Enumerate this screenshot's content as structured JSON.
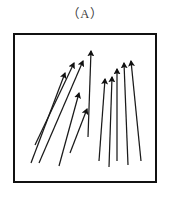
{
  "figure": {
    "caption": "（A）",
    "panel_label": "A",
    "background_color": "#ffffff",
    "frame": {
      "border_color": "#111111",
      "border_width_px": 2,
      "x": 13,
      "y": 33,
      "width": 144,
      "height": 150
    },
    "stroke_color": "#1a1a1a",
    "arrow_count": 11
  },
  "chart_data": {
    "type": "scatter",
    "title": "（A）",
    "xlabel": "",
    "ylabel": "",
    "grid": false,
    "legend": null,
    "xlim": [
      0,
      144
    ],
    "ylim": [
      0,
      150
    ],
    "arrows": [
      {
        "id": 1,
        "x1": 18,
        "y1": 130,
        "x2": 52,
        "y2": 40,
        "angle_deg": 69
      },
      {
        "id": 2,
        "x1": 22,
        "y1": 112,
        "x2": 61,
        "y2": 30,
        "angle_deg": 64
      },
      {
        "id": 3,
        "x1": 26,
        "y1": 130,
        "x2": 70,
        "y2": 28,
        "angle_deg": 67
      },
      {
        "id": 4,
        "x1": 46,
        "y1": 133,
        "x2": 66,
        "y2": 60,
        "angle_deg": 75
      },
      {
        "id": 5,
        "x1": 57,
        "y1": 120,
        "x2": 74,
        "y2": 76,
        "angle_deg": 69
      },
      {
        "id": 6,
        "x1": 75,
        "y1": 104,
        "x2": 78,
        "y2": 18,
        "angle_deg": 88
      },
      {
        "id": 7,
        "x1": 86,
        "y1": 128,
        "x2": 92,
        "y2": 46,
        "angle_deg": 86
      },
      {
        "id": 8,
        "x1": 96,
        "y1": 134,
        "x2": 99,
        "y2": 44,
        "angle_deg": 88
      },
      {
        "id": 9,
        "x1": 104,
        "y1": 128,
        "x2": 104,
        "y2": 36,
        "angle_deg": 90
      },
      {
        "id": 10,
        "x1": 115,
        "y1": 132,
        "x2": 111,
        "y2": 30,
        "angle_deg": 92
      },
      {
        "id": 11,
        "x1": 128,
        "y1": 128,
        "x2": 118,
        "y2": 28,
        "angle_deg": 96
      }
    ]
  }
}
